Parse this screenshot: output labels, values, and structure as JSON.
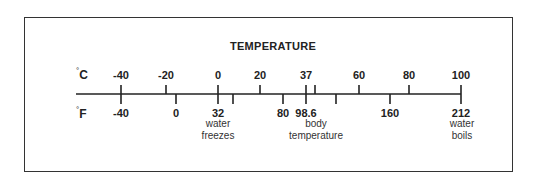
{
  "title": "TEMPERATURE",
  "units": {
    "celsius": {
      "degree": "°",
      "letter": "C"
    },
    "fahrenheit": {
      "degree": "°",
      "letter": "F"
    }
  },
  "axis": {
    "x_start": 76,
    "x_end": 461,
    "y": 94
  },
  "celsius_ticks": [
    {
      "label": "-40",
      "x": 121
    },
    {
      "label": "-20",
      "x": 166
    },
    {
      "label": "0",
      "x": 218
    },
    {
      "label": "20",
      "x": 260
    },
    {
      "label": "37",
      "x": 306
    },
    {
      "label": "",
      "x": 315
    },
    {
      "label": "60",
      "x": 359
    },
    {
      "label": "80",
      "x": 409
    },
    {
      "label": "100",
      "x": 461
    }
  ],
  "fahrenheit_ticks": [
    {
      "label": "-40",
      "x": 121
    },
    {
      "label": "0",
      "x": 176
    },
    {
      "label": "32",
      "x": 218
    },
    {
      "label": "",
      "x": 233
    },
    {
      "label": "80",
      "x": 283
    },
    {
      "label": "98.6",
      "x": 306
    },
    {
      "label": "",
      "x": 336
    },
    {
      "label": "160",
      "x": 390
    },
    {
      "label": "212",
      "x": 461
    }
  ],
  "annotations": [
    {
      "line1": "water",
      "line2": "freezes",
      "x": 218
    },
    {
      "line1": "body",
      "line2": "temperature",
      "x": 316
    },
    {
      "line1": "water",
      "line2": "boils",
      "x": 462
    }
  ],
  "chart_data": {
    "type": "scale",
    "title": "TEMPERATURE",
    "scales": [
      "Celsius",
      "Fahrenheit"
    ],
    "celsius_labels": [
      -40,
      -20,
      0,
      20,
      37,
      60,
      80,
      100
    ],
    "fahrenheit_labels": [
      -40,
      0,
      32,
      80,
      98.6,
      160,
      212
    ],
    "landmarks": [
      {
        "name": "water freezes",
        "celsius": 0,
        "fahrenheit": 32
      },
      {
        "name": "body temperature",
        "celsius": 37,
        "fahrenheit": 98.6
      },
      {
        "name": "water boils",
        "celsius": 100,
        "fahrenheit": 212
      }
    ],
    "equivalence": {
      "celsius": -40,
      "fahrenheit": -40
    }
  }
}
